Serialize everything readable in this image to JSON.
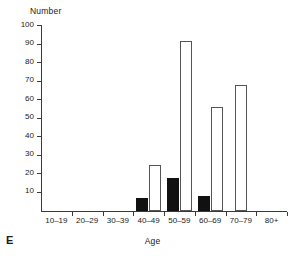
{
  "panel": {
    "letter": "E"
  },
  "chart_data": {
    "type": "bar",
    "title": "",
    "xlabel": "Age",
    "ylabel": "Number",
    "categories": [
      "10–19",
      "20–29",
      "30–39",
      "40–49",
      "50–59",
      "60–69",
      "70–79",
      "80+"
    ],
    "series": [
      {
        "name": "filled",
        "style": "solid-black",
        "values": [
          0,
          0,
          0,
          7,
          18,
          8,
          0,
          0
        ]
      },
      {
        "name": "open",
        "style": "white-outline",
        "values": [
          0,
          0,
          0,
          25,
          92,
          56,
          68,
          0
        ]
      }
    ],
    "ylim": [
      0,
      100
    ],
    "yticks": [
      10,
      20,
      30,
      40,
      50,
      60,
      70,
      80,
      90,
      100
    ],
    "ytick_labels": [
      "10",
      "20",
      "30",
      "40",
      "50",
      "60",
      "70",
      "80",
      "90",
      "100"
    ],
    "grid": false,
    "legend": null,
    "colors": {
      "filled": "#111111",
      "open_fill": "#ffffff",
      "open_stroke": "#555555",
      "axis": "#3a3a3a"
    }
  }
}
